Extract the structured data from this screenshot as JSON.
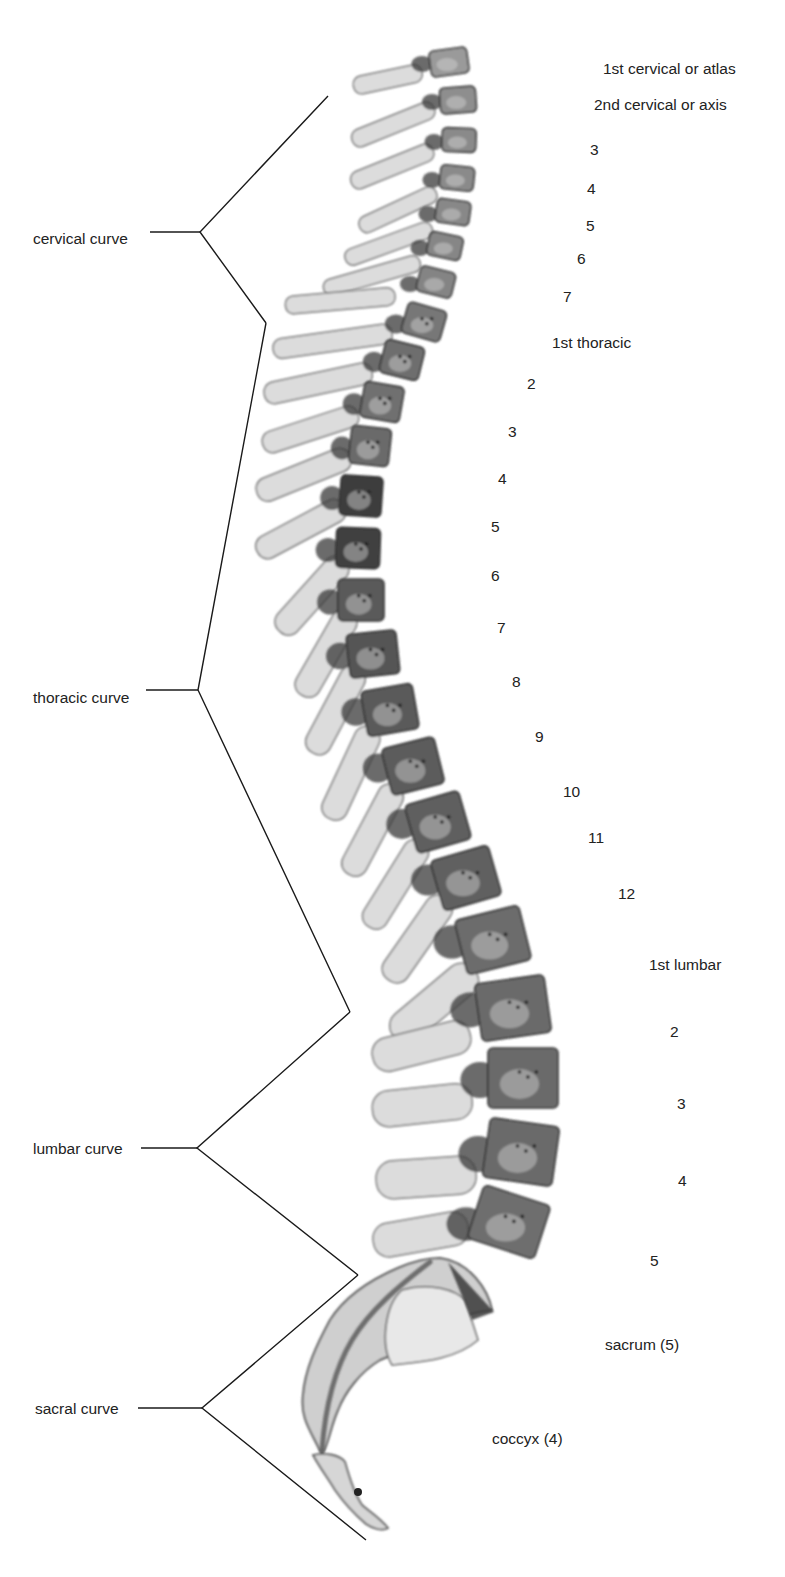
{
  "figure": {
    "curves": [
      {
        "label": "cervical curve",
        "label_x": 33,
        "label_y": 231,
        "line_start": 150,
        "apex": [
          200,
          232
        ],
        "top": [
          328,
          96
        ],
        "bottom": [
          266,
          323
        ]
      },
      {
        "label": "thoracic curve",
        "label_x": 33,
        "label_y": 690,
        "line_start": 146,
        "apex": [
          198,
          690
        ],
        "top": [
          266,
          323
        ],
        "bottom": [
          350,
          1012
        ]
      },
      {
        "label": "lumbar curve",
        "label_x": 33,
        "label_y": 1141,
        "line_start": 141,
        "apex": [
          197,
          1148
        ],
        "top": [
          350,
          1012
        ],
        "bottom": [
          358,
          1275
        ]
      },
      {
        "label": "sacral curve",
        "label_x": 35,
        "label_y": 1401,
        "line_start": 138,
        "apex": [
          202,
          1408
        ],
        "top": [
          358,
          1275
        ],
        "bottom": [
          366,
          1540
        ]
      }
    ],
    "vertebra_labels": [
      {
        "text": "1st cervical or atlas",
        "x": 603,
        "y": 61
      },
      {
        "text": "2nd cervical or axis",
        "x": 594,
        "y": 97
      },
      {
        "text": "3",
        "x": 590,
        "y": 142
      },
      {
        "text": "4",
        "x": 587,
        "y": 181
      },
      {
        "text": "5",
        "x": 586,
        "y": 218
      },
      {
        "text": "6",
        "x": 577,
        "y": 251
      },
      {
        "text": "7",
        "x": 563,
        "y": 289
      },
      {
        "text": "1st thoracic",
        "x": 552,
        "y": 335
      },
      {
        "text": "2",
        "x": 527,
        "y": 376
      },
      {
        "text": "3",
        "x": 508,
        "y": 424
      },
      {
        "text": "4",
        "x": 498,
        "y": 471
      },
      {
        "text": "5",
        "x": 491,
        "y": 519
      },
      {
        "text": "6",
        "x": 491,
        "y": 568
      },
      {
        "text": "7",
        "x": 497,
        "y": 620
      },
      {
        "text": "8",
        "x": 512,
        "y": 674
      },
      {
        "text": "9",
        "x": 535,
        "y": 729
      },
      {
        "text": "10",
        "x": 563,
        "y": 784
      },
      {
        "text": "11",
        "x": 588,
        "y": 830
      },
      {
        "text": "12",
        "x": 618,
        "y": 886
      },
      {
        "text": "1st lumbar",
        "x": 649,
        "y": 957
      },
      {
        "text": "2",
        "x": 670,
        "y": 1024
      },
      {
        "text": "3",
        "x": 677,
        "y": 1096
      },
      {
        "text": "4",
        "x": 678,
        "y": 1173
      },
      {
        "text": "5",
        "x": 650,
        "y": 1253
      },
      {
        "text": "sacrum (5)",
        "x": 605,
        "y": 1337
      },
      {
        "text": "coccyx (4)",
        "x": 492,
        "y": 1431
      }
    ],
    "vertebrae": [
      {
        "region": "cervical",
        "body": [
          430,
          62,
          38,
          26,
          -8
        ],
        "process": [
          352,
          72,
          70,
          18,
          -12
        ],
        "shade": "#9a9a9a"
      },
      {
        "region": "cervical",
        "body": [
          440,
          100,
          36,
          26,
          -4
        ],
        "process": [
          346,
          108,
          88,
          18,
          -22
        ],
        "shade": "#8e8e8e"
      },
      {
        "region": "cervical",
        "body": [
          442,
          140,
          34,
          24,
          2
        ],
        "process": [
          345,
          150,
          88,
          18,
          -22
        ],
        "shade": "#8a8a8a"
      },
      {
        "region": "cervical",
        "body": [
          440,
          178,
          34,
          24,
          6
        ],
        "process": [
          352,
          192,
          84,
          17,
          -25
        ],
        "shade": "#8a8a8a"
      },
      {
        "region": "cervical",
        "body": [
          436,
          212,
          34,
          24,
          8
        ],
        "process": [
          340,
          228,
          92,
          17,
          -20
        ],
        "shade": "#888888"
      },
      {
        "region": "cervical",
        "body": [
          428,
          246,
          34,
          24,
          12
        ],
        "process": [
          320,
          262,
          100,
          17,
          -16
        ],
        "shade": "#868686"
      },
      {
        "region": "cervical",
        "body": [
          418,
          282,
          36,
          26,
          14
        ],
        "process": [
          285,
          296,
          110,
          18,
          -5
        ],
        "shade": "#848484"
      },
      {
        "region": "thoracic",
        "body": [
          404,
          322,
          40,
          32,
          16
        ],
        "process": [
          272,
          333,
          120,
          20,
          -8
        ],
        "shade": "#777777"
      },
      {
        "region": "thoracic",
        "body": [
          382,
          360,
          40,
          34,
          14
        ],
        "process": [
          262,
          372,
          110,
          22,
          -12
        ],
        "shade": "#6e6e6e"
      },
      {
        "region": "thoracic",
        "body": [
          362,
          402,
          40,
          36,
          10
        ],
        "process": [
          258,
          414,
          100,
          22,
          -18
        ],
        "shade": "#707070"
      },
      {
        "region": "thoracic",
        "body": [
          350,
          446,
          40,
          38,
          6
        ],
        "process": [
          250,
          456,
          100,
          24,
          -22
        ],
        "shade": "#6a6a6a"
      },
      {
        "region": "thoracic",
        "body": [
          340,
          496,
          42,
          40,
          4
        ],
        "process": [
          246,
          506,
          98,
          24,
          -28
        ],
        "shade": "#3e3e3e"
      },
      {
        "region": "thoracic",
        "body": [
          336,
          548,
          44,
          40,
          2
        ],
        "process": [
          248,
          560,
          96,
          26,
          -48
        ],
        "shade": "#404040"
      },
      {
        "region": "thoracic",
        "body": [
          338,
          600,
          46,
          42,
          0
        ],
        "process": [
          254,
          612,
          96,
          26,
          -60
        ],
        "shade": "#5a5a5a"
      },
      {
        "region": "thoracic",
        "body": [
          348,
          654,
          50,
          44,
          -6
        ],
        "process": [
          262,
          668,
          96,
          26,
          -62
        ],
        "shade": "#555555"
      },
      {
        "region": "thoracic",
        "body": [
          364,
          710,
          52,
          46,
          -10
        ],
        "process": [
          272,
          728,
          100,
          26,
          -65
        ],
        "shade": "#5a5a5a"
      },
      {
        "region": "thoracic",
        "body": [
          386,
          766,
          54,
          48,
          -14
        ],
        "process": [
          296,
          786,
          100,
          26,
          -62
        ],
        "shade": "#5c5c5c"
      },
      {
        "region": "thoracic",
        "body": [
          410,
          822,
          56,
          50,
          -16
        ],
        "process": [
          322,
          842,
          100,
          26,
          -58
        ],
        "shade": "#5e5e5e"
      },
      {
        "region": "thoracic",
        "body": [
          436,
          878,
          60,
          52,
          -16
        ],
        "process": [
          346,
          898,
          100,
          28,
          -55
        ],
        "shade": "#606060"
      },
      {
        "region": "lumbar",
        "body": [
          460,
          940,
          66,
          56,
          -14
        ],
        "process": [
          370,
          970,
          104,
          34,
          -40
        ],
        "shade": "#6c6c6c"
      },
      {
        "region": "lumbar",
        "body": [
          478,
          1008,
          70,
          58,
          -8
        ],
        "process": [
          370,
          1034,
          100,
          34,
          -14
        ],
        "shade": "#6a6a6a"
      },
      {
        "region": "lumbar",
        "body": [
          488,
          1078,
          70,
          60,
          0
        ],
        "process": [
          372,
          1100,
          100,
          36,
          -6
        ],
        "shade": "#6a6a6a"
      },
      {
        "region": "lumbar",
        "body": [
          486,
          1152,
          70,
          60,
          8
        ],
        "process": [
          376,
          1174,
          100,
          38,
          -4
        ],
        "shade": "#6a6a6a"
      },
      {
        "region": "lumbar",
        "body": [
          474,
          1222,
          70,
          56,
          18
        ],
        "process": [
          372,
          1226,
          96,
          34,
          -10
        ],
        "shade": "#6e6e6e"
      }
    ],
    "colors": {
      "line": "#1a1a1a",
      "bone_light": "#dcdcdc",
      "bone_edge": "#555555",
      "text": "#222222"
    }
  }
}
